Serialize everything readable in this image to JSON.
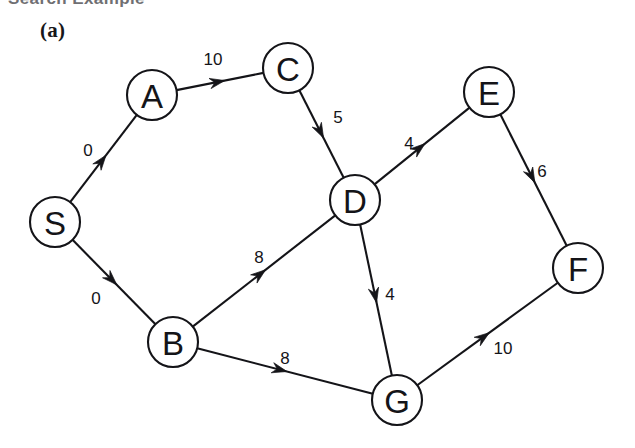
{
  "figure": {
    "clipped_heading": "Search Example",
    "panel_label": "(a)",
    "width": 635,
    "height": 448,
    "background": "#ffffff",
    "ink_color": "#141418"
  },
  "graph": {
    "type": "directed-weighted-graph",
    "node_radius": 25,
    "nodes": [
      {
        "id": "S",
        "label": "S",
        "x": 55,
        "y": 222
      },
      {
        "id": "A",
        "label": "A",
        "x": 152,
        "y": 95
      },
      {
        "id": "B",
        "label": "B",
        "x": 173,
        "y": 342
      },
      {
        "id": "C",
        "label": "C",
        "x": 288,
        "y": 68
      },
      {
        "id": "D",
        "label": "D",
        "x": 355,
        "y": 200
      },
      {
        "id": "E",
        "label": "E",
        "x": 489,
        "y": 92
      },
      {
        "id": "F",
        "label": "F",
        "x": 578,
        "y": 268
      },
      {
        "id": "G",
        "label": "G",
        "x": 397,
        "y": 400
      }
    ],
    "edges": [
      {
        "id": "S-A",
        "from": "S",
        "to": "A",
        "weight": "0",
        "label_x": 88,
        "label_y": 150
      },
      {
        "id": "S-B",
        "from": "S",
        "to": "B",
        "weight": "0",
        "label_x": 96,
        "label_y": 298
      },
      {
        "id": "A-C",
        "from": "A",
        "to": "C",
        "weight": "10",
        "label_x": 213,
        "label_y": 59
      },
      {
        "id": "C-D",
        "from": "C",
        "to": "D",
        "weight": "5",
        "label_x": 338,
        "label_y": 117
      },
      {
        "id": "B-D",
        "from": "B",
        "to": "D",
        "weight": "8",
        "label_x": 259,
        "label_y": 257
      },
      {
        "id": "B-G",
        "from": "B",
        "to": "G",
        "weight": "8",
        "label_x": 285,
        "label_y": 358
      },
      {
        "id": "D-E",
        "from": "D",
        "to": "E",
        "weight": "4",
        "label_x": 409,
        "label_y": 143
      },
      {
        "id": "D-G",
        "from": "D",
        "to": "G",
        "weight": "4",
        "label_x": 390,
        "label_y": 294
      },
      {
        "id": "E-F",
        "from": "E",
        "to": "F",
        "weight": "6",
        "label_x": 542,
        "label_y": 171
      },
      {
        "id": "G-F",
        "from": "G",
        "to": "F",
        "weight": "10",
        "label_x": 503,
        "label_y": 348
      }
    ]
  },
  "chart_data": {
    "type": "diagram",
    "title": "(a)",
    "nodes": [
      "S",
      "A",
      "B",
      "C",
      "D",
      "E",
      "F",
      "G"
    ],
    "edges": [
      {
        "from": "S",
        "to": "A",
        "weight": 0
      },
      {
        "from": "S",
        "to": "B",
        "weight": 0
      },
      {
        "from": "A",
        "to": "C",
        "weight": 10
      },
      {
        "from": "C",
        "to": "D",
        "weight": 5
      },
      {
        "from": "B",
        "to": "D",
        "weight": 8
      },
      {
        "from": "B",
        "to": "G",
        "weight": 8
      },
      {
        "from": "D",
        "to": "E",
        "weight": 4
      },
      {
        "from": "D",
        "to": "G",
        "weight": 4
      },
      {
        "from": "E",
        "to": "F",
        "weight": 6
      },
      {
        "from": "G",
        "to": "F",
        "weight": 10
      }
    ]
  }
}
